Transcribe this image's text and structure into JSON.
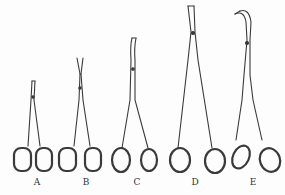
{
  "figure": {
    "type": "illustration",
    "stroke_color": "#3a3a3a",
    "background_color": "#fdfdfd",
    "instruments": [
      {
        "label": "A",
        "label_x": 37,
        "tip_top": 80,
        "blade": "straight-short"
      },
      {
        "label": "B",
        "label_x": 86,
        "tip_top": 58,
        "blade": "angled-fine"
      },
      {
        "label": "C",
        "label_x": 137,
        "tip_top": 38,
        "blade": "curved-tip"
      },
      {
        "label": "D",
        "label_x": 195,
        "tip_top": 5,
        "blade": "straight-long"
      },
      {
        "label": "E",
        "label_x": 253,
        "tip_top": 10,
        "blade": "curved-long-angled-handle"
      }
    ]
  }
}
